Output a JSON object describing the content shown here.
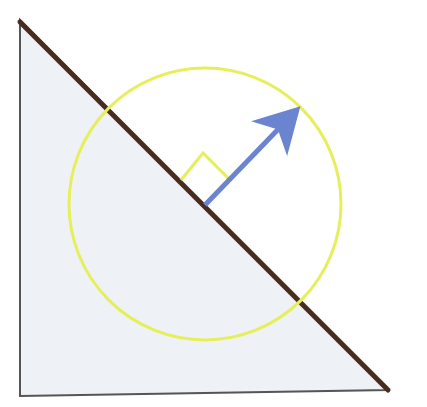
{
  "diagram": {
    "colors": {
      "background": "#ffffff",
      "triangle_fill": "#eef2f7",
      "triangle_edge": "#555555",
      "hypotenuse": "#4a2c1e",
      "circle": "#e6ef5a",
      "arrow": "#6a84d0",
      "right_angle_marker": "#e6ef5a"
    },
    "triangle": {
      "points": [
        [
          20,
          20
        ],
        [
          20,
          396
        ],
        [
          388,
          390
        ]
      ]
    },
    "hypotenuse": {
      "x1": 20,
      "y1": 22,
      "x2": 388,
      "y2": 390
    },
    "circle": {
      "cx": 205,
      "cy": 204,
      "r": 136
    },
    "normal_arrow": {
      "x1": 205,
      "y1": 205,
      "x2": 297,
      "y2": 109
    },
    "right_angle_marker": {
      "points": [
        [
          181,
          180
        ],
        [
          203,
          153
        ],
        [
          228,
          178
        ]
      ]
    }
  }
}
